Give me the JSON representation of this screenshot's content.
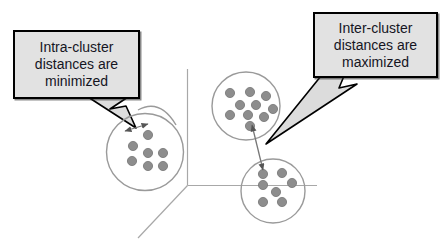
{
  "callouts": {
    "intra": {
      "lines": [
        "Intra-cluster",
        "distances are",
        "minimized"
      ]
    },
    "inter": {
      "lines": [
        "Inter-cluster",
        "distances are",
        "maximized"
      ]
    }
  },
  "colors": {
    "background": "#ffffff",
    "callout_fill": "#e2e2e2",
    "callout_border": "#000000",
    "callout_text": "#15151f",
    "tail_fill": "#dcdcdc",
    "tail_border": "#000000",
    "cluster_outline": "#9a9a9a",
    "dot_fill": "#8d8d8d",
    "dot_outline": "#757575",
    "axis": "#a8a8a8",
    "arrow": "#777777",
    "arrowhead": "#555555"
  },
  "diagram": {
    "clusters": [
      {
        "name": "left-cluster",
        "cx": 145,
        "cy": 152,
        "r": 38.5,
        "dot_r": 4.6,
        "dots": [
          [
            148,
            135
          ],
          [
            133,
            146
          ],
          [
            148,
            153
          ],
          [
            163,
            153
          ],
          [
            132,
            161
          ],
          [
            148,
            166
          ],
          [
            163,
            166
          ]
        ]
      },
      {
        "name": "top-cluster",
        "cx": 246,
        "cy": 106,
        "r": 34,
        "dot_r": 4.6,
        "dots": [
          [
            230,
            93
          ],
          [
            250,
            92
          ],
          [
            266,
            96
          ],
          [
            240,
            105
          ],
          [
            256,
            105
          ],
          [
            273,
            109
          ],
          [
            230,
            115
          ],
          [
            248,
            115
          ],
          [
            264,
            117
          ],
          [
            250,
            126
          ]
        ]
      },
      {
        "name": "bottom-cluster",
        "cx": 273,
        "cy": 191,
        "r": 32,
        "dot_r": 4.6,
        "dots": [
          [
            263,
            174
          ],
          [
            282,
            173
          ],
          [
            263,
            185
          ],
          [
            292,
            183
          ],
          [
            276,
            192
          ],
          [
            263,
            202
          ],
          [
            282,
            202
          ]
        ]
      }
    ],
    "sketch_arcs": [
      {
        "name": "left-cluster-overlap-stroke",
        "d": "M138,110 Q160,98 176,125"
      }
    ],
    "axes": [
      {
        "name": "vertical-axis",
        "x1": 187.5,
        "y1": 69,
        "x2": 187.5,
        "y2": 185.5
      },
      {
        "name": "horizontal-axis",
        "x1": 187.5,
        "y1": 185.5,
        "x2": 317,
        "y2": 185.5
      },
      {
        "name": "diagonal-axis",
        "x1": 187.5,
        "y1": 185.5,
        "x2": 138,
        "y2": 238
      }
    ],
    "arrows": [
      {
        "name": "intra-cluster-distance-arrow",
        "x1": 125,
        "y1": 131,
        "x2": 148,
        "y2": 124
      },
      {
        "name": "inter-cluster-distance-arrow",
        "x1": 252,
        "y1": 125,
        "x2": 263,
        "y2": 170
      }
    ],
    "tails": [
      {
        "name": "intra-callout-tail",
        "points": [
          [
            88,
            97
          ],
          [
            128,
            97
          ],
          [
            110,
            109
          ],
          [
            126,
            106
          ],
          [
            136,
            128
          ]
        ]
      },
      {
        "name": "inter-callout-tail",
        "points": [
          [
            321,
            76
          ],
          [
            344,
            76
          ],
          [
            339,
            88
          ],
          [
            357,
            84
          ],
          [
            266,
            144
          ]
        ]
      }
    ]
  }
}
